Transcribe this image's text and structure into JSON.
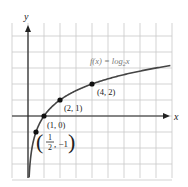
{
  "chart_data": {
    "type": "line",
    "title": "",
    "function_label": "f(x) = log₂x",
    "function_label_parts": {
      "pre": "f(x) = log",
      "sub": "2",
      "post": "x"
    },
    "xlabel": "x",
    "ylabel": "y",
    "grid": true,
    "xlim": [
      -1,
      9
    ],
    "ylim": [
      -4,
      6
    ],
    "series": [
      {
        "name": "f(x) = log2 x",
        "points": [
          [
            0.5,
            -1
          ],
          [
            1,
            0
          ],
          [
            2,
            1
          ],
          [
            4,
            2
          ]
        ]
      }
    ],
    "annotations": [
      {
        "x": 0.5,
        "y": -1,
        "label": "(1/2, -1)",
        "num": "1",
        "den": "2",
        "rest": ", −1"
      },
      {
        "x": 1,
        "y": 0,
        "label": "(1, 0)"
      },
      {
        "x": 2,
        "y": 1,
        "label": "(2, 1)"
      },
      {
        "x": 4,
        "y": 2,
        "label": "(4, 2)"
      }
    ],
    "colors": {
      "curve": "#444444",
      "grid": "#c8c8c8",
      "axis": "#222222",
      "label_fn": "#777777"
    }
  }
}
